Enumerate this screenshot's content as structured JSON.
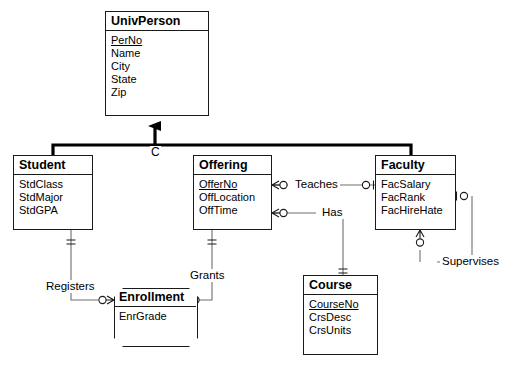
{
  "diagram": {
    "type": "entity-relationship-diagram",
    "notation": "crows-foot",
    "generalization": {
      "label": "C",
      "parent": "UnivPerson",
      "children": [
        "Student",
        "Faculty"
      ]
    }
  },
  "entities": {
    "univperson": {
      "name": "UnivPerson",
      "attributes": [
        {
          "label": "PerNo",
          "key": true
        },
        {
          "label": "Name",
          "key": false
        },
        {
          "label": "City",
          "key": false
        },
        {
          "label": "State",
          "key": false
        },
        {
          "label": "Zip",
          "key": false
        }
      ]
    },
    "student": {
      "name": "Student",
      "attributes": [
        {
          "label": "StdClass",
          "key": false
        },
        {
          "label": "StdMajor",
          "key": false
        },
        {
          "label": "StdGPA",
          "key": false
        }
      ]
    },
    "offering": {
      "name": "Offering",
      "attributes": [
        {
          "label": "OfferNo",
          "key": true
        },
        {
          "label": "OffLocation",
          "key": false
        },
        {
          "label": "OffTime",
          "key": false
        }
      ]
    },
    "faculty": {
      "name": "Faculty",
      "attributes": [
        {
          "label": "FacSalary",
          "key": false
        },
        {
          "label": "FacRank",
          "key": false
        },
        {
          "label": "FacHireHate",
          "key": false
        }
      ]
    },
    "enrollment": {
      "name": "Enrollment",
      "attributes": [
        {
          "label": "EnrGrade",
          "key": false
        }
      ]
    },
    "course": {
      "name": "Course",
      "attributes": [
        {
          "label": "CourseNo",
          "key": true
        },
        {
          "label": "CrsDesc",
          "key": false
        },
        {
          "label": "CrsUnits",
          "key": false
        }
      ]
    }
  },
  "relationships": [
    {
      "id": "teaches",
      "label": "Teaches",
      "from": "Offering",
      "to": "Faculty"
    },
    {
      "id": "has",
      "label": "Has",
      "from": "Offering",
      "to": "Course"
    },
    {
      "id": "registers",
      "label": "Registers",
      "from": "Student",
      "to": "Enrollment"
    },
    {
      "id": "grants",
      "label": "Grants",
      "from": "Offering",
      "to": "Enrollment"
    },
    {
      "id": "supervises",
      "label": "Supervises",
      "from": "Faculty",
      "to": "Faculty"
    }
  ],
  "colors": {
    "line": "#1a1a1a",
    "thin_line": "#6e6e6e",
    "background": "#ffffff",
    "text": "#000000"
  }
}
